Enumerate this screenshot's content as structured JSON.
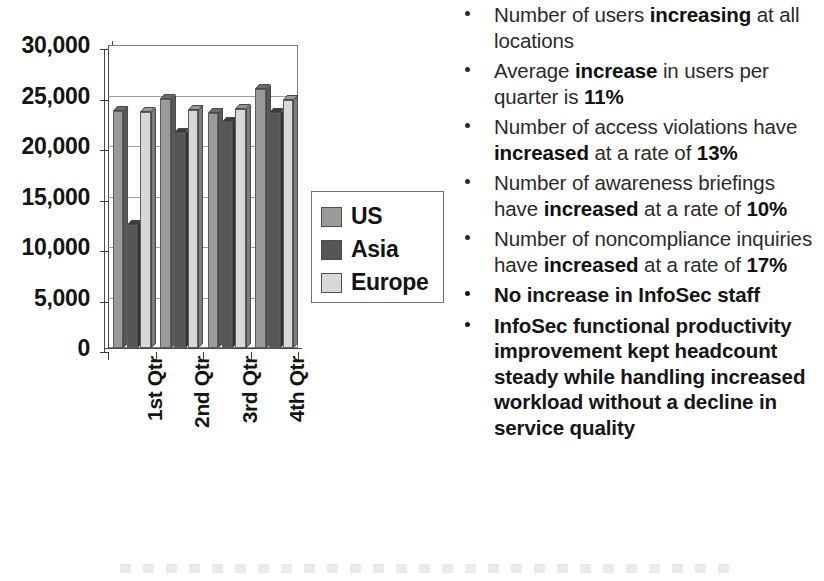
{
  "chart_data": {
    "type": "bar",
    "title": "",
    "xlabel": "",
    "ylabel": "",
    "grid": true,
    "legend_position": "right-inside",
    "categories": [
      "1st Qtr",
      "2nd Qtr",
      "3rd Qtr",
      "4th Qtr"
    ],
    "ylim": [
      0,
      30000
    ],
    "ytick_labels": [
      "30,000",
      "25,000",
      "20,000",
      "15,000",
      "10,000",
      "5,000",
      "0"
    ],
    "yticks": [
      30000,
      25000,
      20000,
      15000,
      10000,
      5000,
      0
    ],
    "series": [
      {
        "name": "US",
        "color": "#9a9a9a",
        "values": [
          23500,
          24700,
          23300,
          25600
        ]
      },
      {
        "name": "Asia",
        "color": "#565656",
        "values": [
          12200,
          21300,
          22400,
          23300
        ]
      },
      {
        "name": "Europe",
        "color": "#d8d8d8",
        "values": [
          23400,
          23600,
          23700,
          24600
        ]
      }
    ]
  },
  "legend": {
    "items": [
      {
        "label": "US",
        "color": "#9a9a9a"
      },
      {
        "label": "Asia",
        "color": "#565656"
      },
      {
        "label": "Europe",
        "color": "#d8d8d8"
      }
    ]
  },
  "bullets": [
    {
      "bold_all": false,
      "runs": [
        {
          "text": "Number of users ",
          "bold": false
        },
        {
          "text": "increasing",
          "bold": true
        },
        {
          "text": " at all locations",
          "bold": false
        }
      ]
    },
    {
      "bold_all": false,
      "runs": [
        {
          "text": "Average ",
          "bold": false
        },
        {
          "text": "increase",
          "bold": true
        },
        {
          "text": " in users per quarter is ",
          "bold": false
        },
        {
          "text": "11%",
          "bold": true
        }
      ]
    },
    {
      "bold_all": false,
      "runs": [
        {
          "text": "Number of access violations have ",
          "bold": false
        },
        {
          "text": "increased",
          "bold": true
        },
        {
          "text": " at a rate of ",
          "bold": false
        },
        {
          "text": "13%",
          "bold": true
        }
      ]
    },
    {
      "bold_all": false,
      "runs": [
        {
          "text": "Number of awareness briefings have ",
          "bold": false
        },
        {
          "text": "increased",
          "bold": true
        },
        {
          "text": " at a rate of ",
          "bold": false
        },
        {
          "text": "10%",
          "bold": true
        }
      ]
    },
    {
      "bold_all": false,
      "runs": [
        {
          "text": "Number of noncompliance inquiries have ",
          "bold": false
        },
        {
          "text": "increased",
          "bold": true
        },
        {
          "text": " at a rate of ",
          "bold": false
        },
        {
          "text": "17%",
          "bold": true
        }
      ]
    },
    {
      "bold_all": true,
      "runs": [
        {
          "text": "No increase in InfoSec staff",
          "bold": true
        }
      ]
    },
    {
      "bold_all": true,
      "runs": [
        {
          "text": "InfoSec functional productivity improvement kept headcount steady while handling increased workload without a decline in service quality",
          "bold": true
        }
      ]
    }
  ]
}
